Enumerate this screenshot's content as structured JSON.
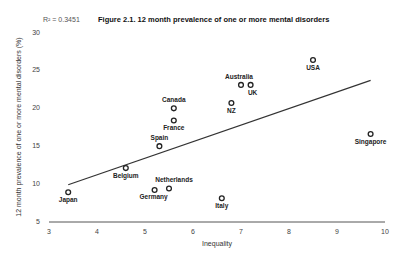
{
  "chart_data": {
    "type": "scatter",
    "title": "Figure 2.1. 12 month prevalence of one or more mental disorders",
    "annotation": "R² = 0.3451",
    "xlabel": "Inequality",
    "ylabel": "12 month prevalence of one or more mental disorders (%)",
    "xlim": [
      3,
      10
    ],
    "ylim": [
      5,
      30
    ],
    "xticks": [
      3,
      4,
      5,
      6,
      7,
      8,
      9,
      10
    ],
    "yticks": [
      5,
      10,
      15,
      20,
      25,
      30
    ],
    "grid": false,
    "trendline": {
      "x": [
        3.4,
        9.7
      ],
      "y": [
        9.8,
        23.6
      ]
    },
    "points": [
      {
        "label": "Japan",
        "x": 3.4,
        "y": 8.8
      },
      {
        "label": "Belgium",
        "x": 4.6,
        "y": 12.0
      },
      {
        "label": "Germany",
        "x": 5.2,
        "y": 9.1
      },
      {
        "label": "Netherlands",
        "x": 5.5,
        "y": 9.3
      },
      {
        "label": "Italy",
        "x": 6.6,
        "y": 8.0
      },
      {
        "label": "Spain",
        "x": 5.3,
        "y": 14.9
      },
      {
        "label": "France",
        "x": 5.6,
        "y": 18.3
      },
      {
        "label": "Canada",
        "x": 5.6,
        "y": 19.9
      },
      {
        "label": "NZ",
        "x": 6.8,
        "y": 20.6
      },
      {
        "label": "Australia",
        "x": 7.0,
        "y": 23.0
      },
      {
        "label": "UK",
        "x": 7.2,
        "y": 23.0
      },
      {
        "label": "USA",
        "x": 8.5,
        "y": 26.3
      },
      {
        "label": "Singapore",
        "x": 9.7,
        "y": 16.5
      }
    ]
  }
}
